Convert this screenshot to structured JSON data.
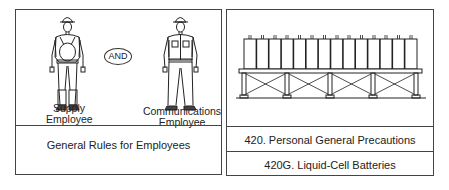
{
  "left_panel": {
    "figures": [
      {
        "label_line1": "Supply",
        "label_line2": "Employee"
      },
      {
        "label_line1": "Communications",
        "label_line2": "Employee"
      }
    ],
    "connector": "AND",
    "caption": "General Rules for Employees"
  },
  "right_panel": {
    "illustration": "liquid-cell battery rack",
    "cell_count": 14,
    "captions": [
      "420. Personal General Precautions",
      "420G. Liquid-Cell Batteries"
    ]
  }
}
